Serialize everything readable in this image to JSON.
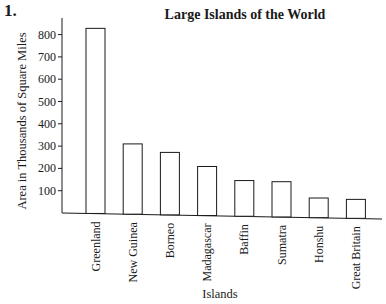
{
  "question_number": "1.",
  "chart_data": {
    "type": "bar",
    "title": "Large Islands of the World",
    "xlabel": "Islands",
    "ylabel": "Area in Thousands of Square Miles",
    "categories": [
      "Greenland",
      "New Guinea",
      "Borneo",
      "Madagascar",
      "Baffin",
      "Sumatra",
      "Honshu",
      "Great Britain"
    ],
    "values": [
      830,
      315,
      280,
      220,
      160,
      158,
      88,
      85
    ],
    "yticks": [
      100,
      200,
      300,
      400,
      500,
      600,
      700,
      800
    ],
    "ylim": [
      0,
      870
    ],
    "grid": false,
    "legend": "none",
    "bar_fill": "#ffffff",
    "bar_stroke": "#1a1a1a"
  }
}
